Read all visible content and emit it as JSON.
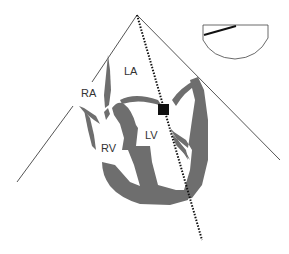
{
  "diagram": {
    "labels": {
      "la": "LA",
      "ra": "RA",
      "lv": "LV",
      "rv": "RV"
    },
    "colors": {
      "myocardium": "#6e6e6e",
      "lines": "#555555",
      "cursor": "#111111",
      "sample_volume": "#111111",
      "background": "#ffffff"
    },
    "elements": {
      "sector": "ultrasound-sector",
      "cursor": "doppler-cursor-line",
      "sample_volume": "sample-volume-gate",
      "inset": "probe-orientation-inset"
    }
  }
}
